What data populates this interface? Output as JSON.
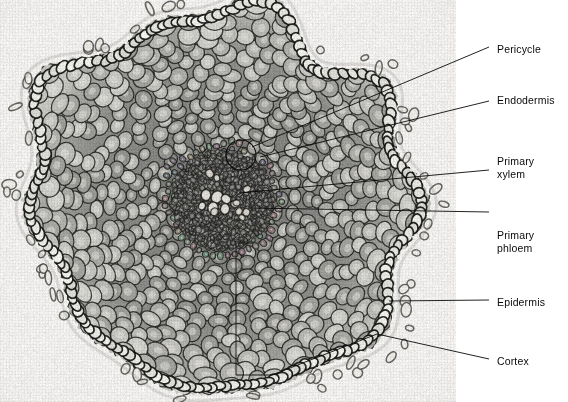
{
  "figure": {
    "kind": "light-micrograph",
    "panel": {
      "width_px": 456,
      "height_px": 402,
      "background_hex": "#f2f1ef"
    },
    "ink_hex": "#0a0a0a"
  },
  "labels": [
    {
      "id": "pericycle",
      "text": "Pericycle",
      "text_x": 497,
      "text_y": 43,
      "leader": {
        "x1": 489,
        "y1": 47,
        "x2": 252,
        "y2": 147
      },
      "marker": {
        "type": "circle",
        "cx": 241,
        "cy": 155,
        "r": 15
      }
    },
    {
      "id": "endodermis",
      "text": "Endodermis",
      "text_x": 497,
      "text_y": 94,
      "leader": {
        "x1": 489,
        "y1": 101,
        "x2": 260,
        "y2": 157
      }
    },
    {
      "id": "primary-xylem",
      "text": "Primary\nxylem",
      "text_x": 497,
      "text_y": 155,
      "leader": {
        "x1": 489,
        "y1": 170,
        "x2": 239,
        "y2": 193
      }
    },
    {
      "id": "primary-phloem",
      "text": "Primary\nphloem",
      "text_x": 497,
      "text_y": 229,
      "leader": {
        "x1": 489,
        "y1": 212,
        "x2": 249,
        "y2": 208
      }
    },
    {
      "id": "epidermis",
      "text": "Epidermis",
      "text_x": 497,
      "text_y": 296,
      "leader": {
        "x1": 489,
        "y1": 300,
        "x2": 389,
        "y2": 301
      }
    },
    {
      "id": "cortex",
      "text": "Cortex",
      "text_x": 497,
      "text_y": 355,
      "leader": {
        "x1": 489,
        "y1": 359,
        "x2": 377,
        "y2": 334
      }
    }
  ],
  "bracket_cortex": {
    "id": "cortex-bracket",
    "points": "253,243 236,243 236,375 272,375 377,334"
  }
}
